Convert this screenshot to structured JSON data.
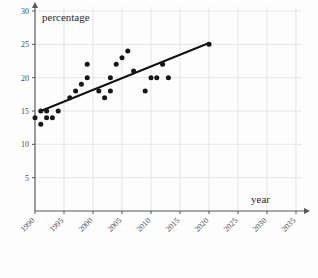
{
  "chart_data": {
    "type": "scatter",
    "title": "",
    "xlabel": "year",
    "ylabel": "percentage",
    "xlim": [
      1990,
      2035
    ],
    "ylim": [
      0,
      30
    ],
    "grid": true,
    "legend": null,
    "x_ticks": [
      1990,
      1995,
      2000,
      2005,
      2010,
      2015,
      2020,
      2025,
      2030,
      2035
    ],
    "y_ticks": [
      5,
      10,
      15,
      20,
      25,
      30
    ],
    "x_tick_labels": [
      "1990",
      "1995",
      "2000",
      "2005",
      "2010",
      "2015",
      "2020",
      "2025",
      "2030",
      "2035"
    ],
    "y_tick_labels": [
      "5",
      "10",
      "15",
      "20",
      "25",
      "30"
    ],
    "x_tick_label_rotation": -45,
    "points": [
      {
        "x": 1990,
        "y": 14
      },
      {
        "x": 1991,
        "y": 15
      },
      {
        "x": 1991,
        "y": 13
      },
      {
        "x": 1992,
        "y": 15
      },
      {
        "x": 1992,
        "y": 14
      },
      {
        "x": 1993,
        "y": 14
      },
      {
        "x": 1994,
        "y": 15
      },
      {
        "x": 1996,
        "y": 17
      },
      {
        "x": 1997,
        "y": 18
      },
      {
        "x": 1998,
        "y": 19
      },
      {
        "x": 1999,
        "y": 20
      },
      {
        "x": 1999,
        "y": 22
      },
      {
        "x": 2001,
        "y": 18
      },
      {
        "x": 2002,
        "y": 17
      },
      {
        "x": 2003,
        "y": 18
      },
      {
        "x": 2003,
        "y": 20
      },
      {
        "x": 2004,
        "y": 22
      },
      {
        "x": 2005,
        "y": 23
      },
      {
        "x": 2006,
        "y": 24
      },
      {
        "x": 2007,
        "y": 21
      },
      {
        "x": 2009,
        "y": 18
      },
      {
        "x": 2010,
        "y": 20
      },
      {
        "x": 2011,
        "y": 20
      },
      {
        "x": 2012,
        "y": 22
      },
      {
        "x": 2013,
        "y": 20
      },
      {
        "x": 2020,
        "y": 25
      }
    ],
    "trend_line": {
      "type": "line",
      "start": {
        "x": 1991,
        "y": 15
      },
      "end": {
        "x": 2020,
        "y": 25.2
      }
    }
  }
}
